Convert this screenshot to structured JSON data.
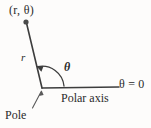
{
  "figure": {
    "type": "geometry-diagram",
    "background_color": "#fdfcfb",
    "ink_color": "#3a3a3a",
    "labels": {
      "point": "(r, θ)",
      "radius": "r",
      "angle": "θ",
      "angle_zero": "θ = 0",
      "polar_axis": "Polar axis",
      "pole": "Pole"
    },
    "geometry": {
      "pole_point": [
        42,
        88
      ],
      "point_marker": [
        26,
        22
      ],
      "polar_axis_end": [
        119,
        87
      ],
      "ray_angle_degrees": 105,
      "arc_radius": 22,
      "leader_line_from": [
        33,
        108
      ],
      "leader_line_to": [
        41,
        92
      ]
    }
  }
}
